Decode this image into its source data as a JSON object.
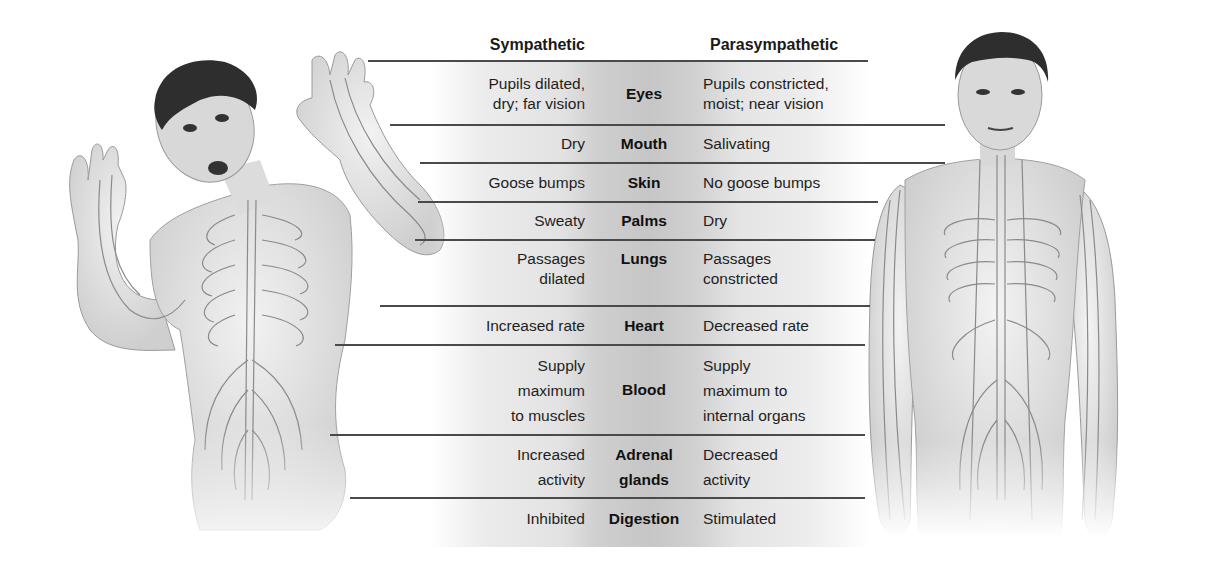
{
  "columns": {
    "sympathetic": "Sympathetic",
    "parasympathetic": "Parasympathetic"
  },
  "rows": [
    {
      "organ": "Eyes",
      "sympathetic": "Pupils dilated,\ndry; far vision",
      "parasympathetic": "Pupils constricted,\nmoist; near vision"
    },
    {
      "organ": "Mouth",
      "sympathetic": "Dry",
      "parasympathetic": "Salivating"
    },
    {
      "organ": "Skin",
      "sympathetic": "Goose bumps",
      "parasympathetic": "No goose bumps"
    },
    {
      "organ": "Palms",
      "sympathetic": "Sweaty",
      "parasympathetic": "Dry"
    },
    {
      "organ": "Lungs",
      "sympathetic": "Passages\ndilated",
      "parasympathetic": "Passages\nconstricted"
    },
    {
      "organ": "Heart",
      "sympathetic": "Increased rate",
      "parasympathetic": "Decreased rate"
    },
    {
      "organ": "Blood",
      "sympathetic": "Supply\nmaximum\nto muscles",
      "parasympathetic": "Supply\nmaximum to\ninternal organs"
    },
    {
      "organ": "Adrenal\nglands",
      "sympathetic": "Increased\nactivity",
      "parasympathetic": "Decreased\nactivity"
    },
    {
      "organ": "Digestion",
      "sympathetic": "Inhibited",
      "parasympathetic": "Stimulated"
    }
  ],
  "figures": {
    "left": "Frightened man (sympathetic arousal) with nerve pathways drawn on torso and arms",
    "right": "Calm man (parasympathetic state) with nerve pathways drawn on torso and arms"
  },
  "colors": {
    "rule": "#4a4a4a",
    "band_center": "#c6c6c6",
    "text": "#1e1e1e",
    "skin": "#e6e6e6",
    "hair": "#2e2e2e",
    "nerve": "#8a8a8a"
  }
}
